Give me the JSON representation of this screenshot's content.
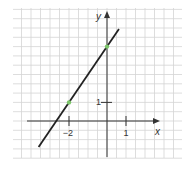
{
  "chart_data": {
    "type": "line",
    "title": "",
    "xlabel": "x",
    "ylabel": "y",
    "xlim": [
      -4.5,
      4.0
    ],
    "ylim": [
      -2.0,
      6.0
    ],
    "grid": true,
    "grid_step": 0.5,
    "x_ticks": [
      {
        "value": -2,
        "label": "−2"
      },
      {
        "value": 1,
        "label": "1"
      }
    ],
    "y_ticks": [
      {
        "value": 1,
        "label": "1"
      }
    ],
    "series": [
      {
        "name": "y = 1.5x + 4",
        "slope": 1.5,
        "intercept": 4,
        "x": [
          -3.6,
          0.63
        ],
        "y": [
          -1.4,
          4.95
        ],
        "color": "#222222"
      }
    ],
    "points": [
      {
        "x": -2,
        "y": 1,
        "color": "#7cc66a"
      },
      {
        "x": 0,
        "y": 4,
        "color": "#7cc66a"
      }
    ]
  },
  "axes": {
    "x_label": "x",
    "y_label": "y",
    "x_tick_labels": [
      "−2",
      "1"
    ],
    "y_tick_labels": [
      "1"
    ]
  },
  "colors": {
    "grid": "#d4d4d4",
    "axis": "#333333",
    "line": "#222222",
    "point": "#7cc66a",
    "background": "#ffffff"
  }
}
